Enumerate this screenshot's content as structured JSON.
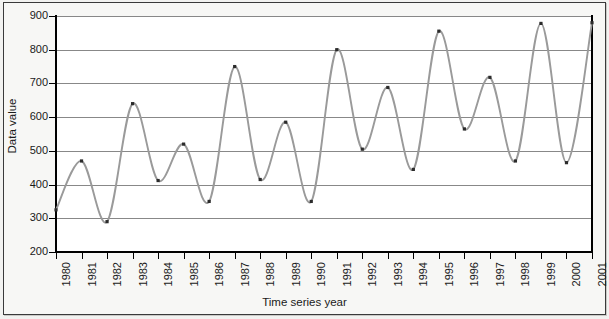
{
  "chart_data": {
    "type": "line",
    "title": "",
    "xlabel": "Time series year",
    "ylabel": "Data value",
    "x": [
      1980,
      1981,
      1982,
      1983,
      1984,
      1985,
      1986,
      1987,
      1988,
      1989,
      1990,
      1991,
      1992,
      1993,
      1994,
      1995,
      1996,
      1997,
      1998,
      1999,
      2000,
      2001
    ],
    "values": [
      325,
      470,
      290,
      640,
      412,
      520,
      350,
      750,
      415,
      585,
      350,
      800,
      505,
      688,
      445,
      855,
      565,
      718,
      470,
      878,
      465,
      880
    ],
    "categories": [
      "1980",
      "1981",
      "1982",
      "1983",
      "1984",
      "1985",
      "1986",
      "1987",
      "1988",
      "1989",
      "1990",
      "1991",
      "1992",
      "1993",
      "1994",
      "1995",
      "1996",
      "1997",
      "1998",
      "1999",
      "2000",
      "2001"
    ],
    "ylim": [
      200,
      900
    ],
    "yticks": [
      200,
      300,
      400,
      500,
      600,
      700,
      800,
      900
    ],
    "ytick_labels": [
      "200",
      "300",
      "400",
      "500",
      "600",
      "700",
      "800",
      "900"
    ],
    "xlim": [
      1980,
      2001
    ],
    "grid": "horizontal",
    "legend": "none",
    "series_color": "#9a9a9a",
    "marker_color": "#2b2b2b",
    "smoothing": "spline",
    "series": [
      {
        "name": "Data value",
        "values": [
          325,
          470,
          290,
          640,
          412,
          520,
          350,
          750,
          415,
          585,
          350,
          800,
          505,
          688,
          445,
          855,
          565,
          718,
          470,
          878,
          465,
          880
        ]
      }
    ]
  },
  "figure": {
    "background_color": "#f7f7f5",
    "plot_background_color": "#ffffff",
    "border_color": "#3a3a3a",
    "gridline_color": "#888888",
    "axis_color": "#000000"
  }
}
